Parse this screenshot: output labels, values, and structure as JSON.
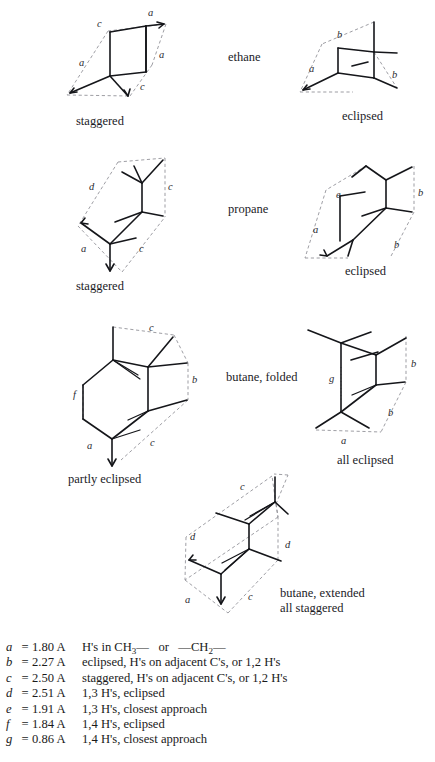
{
  "figure": {
    "molecules": [
      {
        "name": "ethane",
        "conformers": [
          {
            "label": "staggered",
            "distance_labels": [
              "a",
              "c",
              "a",
              "a",
              "c"
            ]
          },
          {
            "label": "eclipsed",
            "distance_labels": [
              "b",
              "a",
              "b"
            ]
          }
        ]
      },
      {
        "name": "propane",
        "conformers": [
          {
            "label": "staggered",
            "distance_labels": [
              "d",
              "c",
              "a",
              "c"
            ]
          },
          {
            "label": "eclipsed",
            "distance_labels": [
              "e",
              "b",
              "a",
              "b"
            ]
          }
        ]
      },
      {
        "name": "butane, folded",
        "conformers": [
          {
            "label": "partly eclipsed",
            "distance_labels": [
              "c",
              "b",
              "f",
              "a",
              "c"
            ]
          },
          {
            "label": "all eclipsed",
            "distance_labels": [
              "b",
              "g",
              "b",
              "a"
            ]
          }
        ]
      },
      {
        "name": "butane, extended",
        "conformers": [
          {
            "label": "all staggered",
            "distance_labels": [
              "c",
              "d",
              "d",
              "a",
              "c"
            ]
          }
        ]
      }
    ],
    "labels": {
      "ethane": "ethane",
      "propane": "propane",
      "butane_folded": "butane, folded",
      "butane_extended_line1": "butane, extended",
      "butane_extended_line2": "all staggered",
      "staggered": "staggered",
      "eclipsed": "eclipsed",
      "partly_eclipsed": "partly eclipsed",
      "all_eclipsed": "all eclipsed"
    },
    "distance_marks": {
      "eth_s_a_top": "a",
      "eth_s_c_top": "c",
      "eth_s_a_right": "a",
      "eth_s_a_left": "a",
      "eth_s_c_bottom": "c",
      "eth_e_b_top": "b",
      "eth_e_a_left": "a",
      "eth_e_b_right": "b",
      "pro_s_d": "d",
      "pro_s_c_right": "c",
      "pro_s_a": "a",
      "pro_s_c_bottom": "c",
      "pro_e_e": "e",
      "pro_e_b_right": "b",
      "pro_e_a": "a",
      "pro_e_b_bottom": "b",
      "but_f_c_top": "c",
      "but_f_b": "b",
      "but_f_f": "f",
      "but_f_a": "a",
      "but_f_c_bottom": "c",
      "but_ae_b_top": "b",
      "but_ae_g": "g",
      "but_ae_b_bottom": "b",
      "but_ae_a": "a",
      "but_x_c_top": "c",
      "but_x_d_left": "d",
      "but_x_d_right": "d",
      "but_x_a": "a",
      "but_x_c_bottom": "c"
    }
  },
  "legend": {
    "rows": [
      {
        "key": "a",
        "eq": "=",
        "value": "1.80 A",
        "description": "H's in CH3—   or   —CH2—",
        "desc_html": "H's in CH<sub>3</sub>&mdash;&nbsp;&nbsp; or &nbsp;&nbsp;&mdash;CH<sub>2</sub>&mdash;"
      },
      {
        "key": "b",
        "eq": "=",
        "value": "2.27 A",
        "description": "eclipsed, H's on adjacent C's, or 1,2 H's",
        "desc_html": "eclipsed, H's on adjacent C's, or 1,2 H's"
      },
      {
        "key": "c",
        "eq": "=",
        "value": "2.50 A",
        "description": "staggered, H's on adjacent C's, or 1,2 H's",
        "desc_html": "staggered, H's on adjacent C's, or 1,2 H's"
      },
      {
        "key": "d",
        "eq": "=",
        "value": "2.51 A",
        "description": "1,3 H's, eclipsed",
        "desc_html": "1,3 H's, eclipsed"
      },
      {
        "key": "e",
        "eq": "=",
        "value": "1.91 A",
        "description": "1,3 H's, closest approach",
        "desc_html": "1,3 H's, closest approach"
      },
      {
        "key": "f",
        "eq": "=",
        "value": "1.84 A",
        "description": "1,4 H's, eclipsed",
        "desc_html": "1,4 H's, eclipsed"
      },
      {
        "key": "g",
        "eq": "=",
        "value": "0.86 A",
        "description": "1,4 H's, closest approach",
        "desc_html": "1,4 H's, closest approach"
      }
    ]
  },
  "colors": {
    "bond": "#15161a",
    "guide": "#8d8d93",
    "text": "#1b1b1f",
    "background": "#ffffff"
  }
}
